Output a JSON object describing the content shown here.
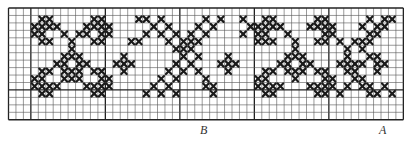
{
  "grid": {
    "cols": 53,
    "rows": 15,
    "cell": 7.45,
    "origin_x": 8.5,
    "origin_y": 8,
    "heavy_cols": [
      3,
      13,
      23,
      33,
      43
    ],
    "heavy_rows": [
      0,
      11
    ],
    "line_color": "#555555",
    "heavy_color": "#222222",
    "stitch_color": "#1a1a1a"
  },
  "markers": [
    {
      "id": "B",
      "label": "B",
      "x": 200,
      "y": 124
    },
    {
      "id": "A",
      "label": "A",
      "x": 379,
      "y": 124
    }
  ],
  "stitches": [
    [
      4,
      1
    ],
    [
      5,
      1
    ],
    [
      3,
      2
    ],
    [
      4,
      2
    ],
    [
      5,
      2
    ],
    [
      6,
      2
    ],
    [
      3,
      3
    ],
    [
      4,
      3
    ],
    [
      7,
      3
    ],
    [
      4,
      4
    ],
    [
      5,
      4
    ],
    [
      11,
      1
    ],
    [
      12,
      1
    ],
    [
      10,
      2
    ],
    [
      11,
      2
    ],
    [
      12,
      2
    ],
    [
      13,
      2
    ],
    [
      12,
      3
    ],
    [
      13,
      3
    ],
    [
      8,
      4
    ],
    [
      11,
      4
    ],
    [
      12,
      4
    ],
    [
      9,
      3
    ],
    [
      10,
      3
    ],
    [
      8,
      5
    ],
    [
      7,
      6
    ],
    [
      8,
      6
    ],
    [
      9,
      6
    ],
    [
      6,
      7
    ],
    [
      7,
      7
    ],
    [
      9,
      7
    ],
    [
      10,
      7
    ],
    [
      7,
      8
    ],
    [
      8,
      8
    ],
    [
      9,
      8
    ],
    [
      8,
      9
    ],
    [
      4,
      8
    ],
    [
      5,
      8
    ],
    [
      3,
      9
    ],
    [
      4,
      9
    ],
    [
      3,
      10
    ],
    [
      4,
      10
    ],
    [
      5,
      10
    ],
    [
      6,
      10
    ],
    [
      4,
      11
    ],
    [
      5,
      11
    ],
    [
      7,
      9
    ],
    [
      11,
      8
    ],
    [
      12,
      8
    ],
    [
      12,
      9
    ],
    [
      13,
      9
    ],
    [
      10,
      10
    ],
    [
      11,
      10
    ],
    [
      12,
      10
    ],
    [
      13,
      10
    ],
    [
      11,
      11
    ],
    [
      12,
      11
    ],
    [
      9,
      9
    ],
    [
      15,
      6
    ],
    [
      14,
      7
    ],
    [
      15,
      7
    ],
    [
      16,
      7
    ],
    [
      15,
      8
    ],
    [
      18,
      1
    ],
    [
      19,
      2
    ],
    [
      20,
      3
    ],
    [
      21,
      4
    ],
    [
      22,
      5
    ],
    [
      23,
      6
    ],
    [
      24,
      7
    ],
    [
      25,
      8
    ],
    [
      26,
      9
    ],
    [
      27,
      10
    ],
    [
      20,
      1
    ],
    [
      21,
      2
    ],
    [
      22,
      3
    ],
    [
      23,
      4
    ],
    [
      24,
      5
    ],
    [
      25,
      6
    ],
    [
      28,
      1
    ],
    [
      27,
      2
    ],
    [
      26,
      3
    ],
    [
      25,
      4
    ],
    [
      24,
      4
    ],
    [
      23,
      5
    ],
    [
      22,
      7
    ],
    [
      21,
      8
    ],
    [
      20,
      9
    ],
    [
      19,
      10
    ],
    [
      18,
      11
    ],
    [
      26,
      1
    ],
    [
      25,
      2
    ],
    [
      24,
      3
    ],
    [
      23,
      8
    ],
    [
      22,
      9
    ],
    [
      21,
      10
    ],
    [
      20,
      11
    ],
    [
      26,
      10
    ],
    [
      27,
      11
    ],
    [
      22,
      11
    ],
    [
      17,
      1
    ],
    [
      18,
      3
    ],
    [
      17,
      4
    ],
    [
      16,
      4
    ],
    [
      29,
      6
    ],
    [
      28,
      7
    ],
    [
      29,
      7
    ],
    [
      30,
      7
    ],
    [
      29,
      8
    ],
    [
      34,
      1
    ],
    [
      35,
      1
    ],
    [
      33,
      2
    ],
    [
      34,
      2
    ],
    [
      35,
      2
    ],
    [
      36,
      2
    ],
    [
      33,
      3
    ],
    [
      34,
      3
    ],
    [
      37,
      3
    ],
    [
      34,
      4
    ],
    [
      35,
      4
    ],
    [
      41,
      1
    ],
    [
      42,
      1
    ],
    [
      40,
      2
    ],
    [
      41,
      2
    ],
    [
      42,
      2
    ],
    [
      43,
      2
    ],
    [
      42,
      3
    ],
    [
      43,
      3
    ],
    [
      38,
      4
    ],
    [
      41,
      4
    ],
    [
      42,
      4
    ],
    [
      38,
      5
    ],
    [
      37,
      6
    ],
    [
      38,
      6
    ],
    [
      39,
      6
    ],
    [
      36,
      7
    ],
    [
      37,
      7
    ],
    [
      39,
      7
    ],
    [
      40,
      7
    ],
    [
      37,
      8
    ],
    [
      38,
      8
    ],
    [
      39,
      8
    ],
    [
      38,
      9
    ],
    [
      34,
      8
    ],
    [
      35,
      8
    ],
    [
      33,
      9
    ],
    [
      34,
      9
    ],
    [
      33,
      10
    ],
    [
      34,
      10
    ],
    [
      35,
      10
    ],
    [
      36,
      10
    ],
    [
      34,
      11
    ],
    [
      35,
      11
    ],
    [
      41,
      8
    ],
    [
      42,
      8
    ],
    [
      42,
      9
    ],
    [
      43,
      9
    ],
    [
      40,
      10
    ],
    [
      41,
      10
    ],
    [
      42,
      10
    ],
    [
      43,
      10
    ],
    [
      41,
      11
    ],
    [
      42,
      11
    ],
    [
      45,
      6
    ],
    [
      44,
      7
    ],
    [
      45,
      7
    ],
    [
      46,
      7
    ],
    [
      45,
      8
    ],
    [
      48,
      1
    ],
    [
      50,
      1
    ],
    [
      47,
      2
    ],
    [
      49,
      2
    ],
    [
      48,
      3
    ],
    [
      46,
      4
    ],
    [
      47,
      4
    ],
    [
      45,
      5
    ],
    [
      44,
      4
    ],
    [
      51,
      1
    ],
    [
      50,
      2
    ],
    [
      49,
      3
    ],
    [
      48,
      4
    ],
    [
      47,
      5
    ],
    [
      46,
      9
    ],
    [
      47,
      10
    ],
    [
      48,
      11
    ],
    [
      45,
      10
    ],
    [
      44,
      11
    ],
    [
      31,
      1
    ],
    [
      32,
      2
    ],
    [
      31,
      3
    ],
    [
      33,
      4
    ],
    [
      47,
      7
    ],
    [
      48,
      6
    ],
    [
      49,
      6
    ],
    [
      50,
      7
    ],
    [
      49,
      8
    ],
    [
      49,
      7
    ],
    [
      46,
      8
    ],
    [
      47,
      9
    ],
    [
      48,
      10
    ],
    [
      49,
      11
    ],
    [
      50,
      10
    ],
    [
      51,
      11
    ]
  ]
}
